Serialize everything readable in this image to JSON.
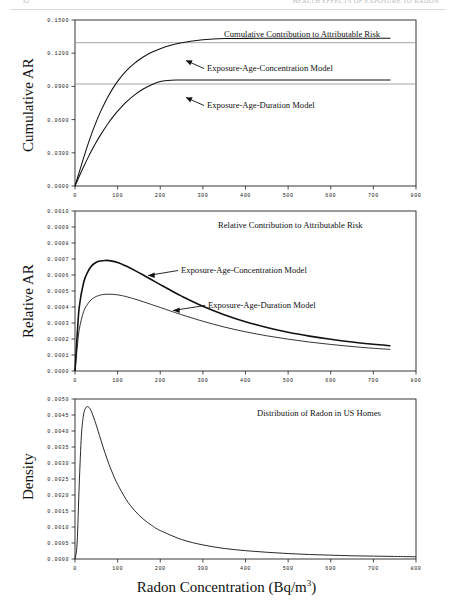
{
  "header": {
    "page_number": "32",
    "running_title": "HEALTH EFFECTS OF EXPOSURE TO RADON"
  },
  "axis_title_x": "Radon Concentration (Bq/m",
  "axis_title_x_sup": "3",
  "axis_title_x_end": ")",
  "panels": [
    {
      "id": "cumulative",
      "ylabel": "Cumulative AR",
      "title": "Cumulative Contribution to Attributable Risk",
      "annotations": [
        {
          "label": "Exposure-Age-Concentration Model"
        },
        {
          "label": "Exposure-Age-Duration Model"
        }
      ],
      "yticks": [
        "0.0000",
        "0.0300",
        "0.0600",
        "0.0900",
        "0.1200",
        "0.1500"
      ],
      "xticks": [
        "0",
        "100",
        "200",
        "300",
        "400",
        "500",
        "600",
        "700",
        "800"
      ]
    },
    {
      "id": "relative",
      "ylabel": "Relative AR",
      "title": "Relative Contribution to Attributable Risk",
      "annotations": [
        {
          "label": "Exposure-Age-Concentration Model"
        },
        {
          "label": "Exposure-Age-Duration Model"
        }
      ],
      "yticks": [
        "0.0000",
        "0.0001",
        "0.0002",
        "0.0003",
        "0.0004",
        "0.0005",
        "0.0006",
        "0.0007",
        "0.0008",
        "0.0009",
        "0.0010"
      ],
      "xticks": [
        "0",
        "100",
        "200",
        "300",
        "400",
        "500",
        "600",
        "700",
        "800"
      ]
    },
    {
      "id": "density",
      "ylabel": "Density",
      "title": "Distribution of Radon in US Homes",
      "annotations": [],
      "yticks": [
        "0.0000",
        "0.0005",
        "0.0010",
        "0.0015",
        "0.0020",
        "0.0025",
        "0.0030",
        "0.0035",
        "0.0040",
        "0.0045",
        "0.0050"
      ],
      "xticks": [
        "0",
        "100",
        "200",
        "300",
        "400",
        "500",
        "600",
        "700",
        "800"
      ]
    }
  ],
  "chart_data": [
    {
      "type": "line",
      "panel": "cumulative",
      "title": "Cumulative Contribution to Attributable Risk",
      "xlabel": "Radon Concentration (Bq/m3)",
      "ylabel": "Cumulative AR",
      "xlim": [
        0,
        800
      ],
      "ylim": [
        0,
        0.15
      ],
      "grid": false,
      "legend_position": "inline-annotation",
      "reference_lines": [
        {
          "name": "asymptote-exposure-age-concentration",
          "y": 0.1335
        },
        {
          "name": "asymptote-exposure-age-duration",
          "y": 0.0958
        }
      ],
      "x": [
        0,
        10,
        20,
        30,
        40,
        50,
        60,
        70,
        80,
        90,
        100,
        120,
        140,
        160,
        180,
        200,
        225,
        250,
        275,
        300,
        350,
        400,
        450,
        500,
        550,
        600,
        650,
        700,
        740
      ],
      "series": [
        {
          "name": "Exposure-Age-Concentration Model",
          "values": [
            0,
            0.0126,
            0.0252,
            0.0372,
            0.0482,
            0.0582,
            0.0672,
            0.0753,
            0.0825,
            0.0889,
            0.0946,
            0.104,
            0.1111,
            0.1166,
            0.1208,
            0.1241,
            0.1272,
            0.1294,
            0.131,
            0.1322,
            0.1332,
            0.1334,
            0.1335,
            0.1335,
            0.1335,
            0.1335,
            0.1335,
            0.1335,
            0.1335
          ]
        },
        {
          "name": "Exposure-Age-Duration Model",
          "values": [
            0,
            0.0088,
            0.0172,
            0.0252,
            0.0327,
            0.0397,
            0.0462,
            0.0522,
            0.0578,
            0.0629,
            0.0676,
            0.0758,
            0.0824,
            0.0876,
            0.0915,
            0.0944,
            0.0956,
            0.0957,
            0.0958,
            0.0958,
            0.0958,
            0.0958,
            0.0958,
            0.0958,
            0.0958,
            0.0958,
            0.0958,
            0.0958,
            0.0958
          ]
        }
      ]
    },
    {
      "type": "line",
      "panel": "relative",
      "title": "Relative Contribution to Attributable Risk",
      "xlabel": "Radon Concentration (Bq/m3)",
      "ylabel": "Relative AR",
      "xlim": [
        0,
        800
      ],
      "ylim": [
        0,
        0.001
      ],
      "grid": false,
      "legend_position": "inline-annotation",
      "x": [
        0,
        5,
        10,
        20,
        30,
        40,
        50,
        60,
        70,
        80,
        90,
        100,
        110,
        120,
        140,
        160,
        180,
        200,
        225,
        250,
        300,
        350,
        400,
        450,
        500,
        550,
        600,
        650,
        700,
        740
      ],
      "series": [
        {
          "name": "Exposure-Age-Concentration Model",
          "values": [
            0,
            0.00022,
            0.0004,
            0.00055,
            0.00062,
            0.00066,
            0.00068,
            0.000688,
            0.000691,
            0.00069,
            0.000685,
            0.000678,
            0.000668,
            0.000656,
            0.000629,
            0.0006,
            0.00057,
            0.00054,
            0.000503,
            0.000468,
            0.000405,
            0.000352,
            0.000308,
            0.000272,
            0.000242,
            0.000218,
            0.000198,
            0.000181,
            0.000167,
            0.000158
          ],
          "peak": {
            "x": 75,
            "y": 0.00069
          }
        },
        {
          "name": "Exposure-Age-Duration Model",
          "values": [
            0,
            0.00014,
            0.00026,
            0.00037,
            0.00042,
            0.00045,
            0.000466,
            0.000475,
            0.000479,
            0.00048,
            0.000479,
            0.000476,
            0.000471,
            0.000465,
            0.00045,
            0.000433,
            0.000415,
            0.000397,
            0.000374,
            0.000352,
            0.000311,
            0.000275,
            0.000245,
            0.00022,
            0.000199,
            0.000181,
            0.000166,
            0.000153,
            0.000142,
            0.000135
          ],
          "peak": {
            "x": 85,
            "y": 0.00048
          }
        }
      ]
    },
    {
      "type": "line",
      "panel": "density",
      "title": "Distribution of Radon in US Homes",
      "xlabel": "Radon Concentration (Bq/m3)",
      "ylabel": "Density",
      "xlim": [
        0,
        800
      ],
      "ylim": [
        0,
        0.005
      ],
      "grid": false,
      "legend_position": "none",
      "x": [
        0,
        5,
        10,
        15,
        20,
        25,
        30,
        35,
        40,
        45,
        50,
        60,
        70,
        80,
        90,
        100,
        120,
        140,
        160,
        180,
        200,
        250,
        300,
        350,
        400,
        450,
        500,
        550,
        600,
        650,
        700,
        750,
        800
      ],
      "series": [
        {
          "name": "Lognormal density of US home radon",
          "values": [
            0,
            0.0005,
            0.00235,
            0.00385,
            0.0045,
            0.00472,
            0.00476,
            0.0047,
            0.00456,
            0.00438,
            0.00418,
            0.00375,
            0.00333,
            0.00295,
            0.00262,
            0.00233,
            0.00186,
            0.00151,
            0.00125,
            0.00105,
            0.00089,
            0.00061,
            0.00044,
            0.00033,
            0.00026,
            0.00021,
            0.00017,
            0.00014,
            0.00012,
            0.0001,
            9e-05,
            8e-05,
            7e-05
          ],
          "peak": {
            "x": 30,
            "y": 0.00476
          }
        }
      ]
    }
  ]
}
